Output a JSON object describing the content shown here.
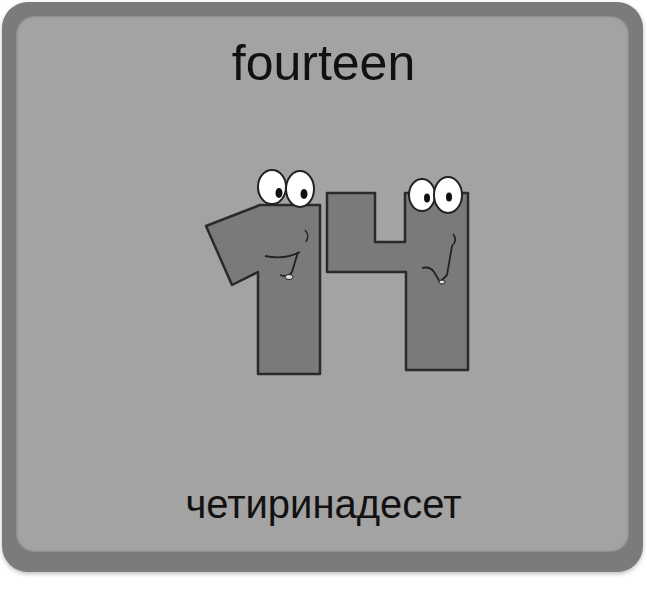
{
  "card": {
    "title": "fourteen",
    "subtitle": "четиринадесет",
    "illustration": {
      "label": "14",
      "description": "cartoon number 14 with eyes and smiling faces"
    }
  },
  "colors": {
    "background": "#ffffff",
    "card_border": "#7b7b7b",
    "card_panel": "#a3a3a3",
    "digit_fill": "#7a7a7a",
    "digit_outline": "#2a2a2a",
    "text": "#111111"
  }
}
